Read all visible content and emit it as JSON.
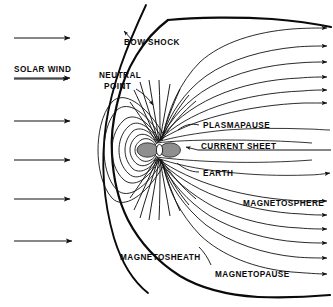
{
  "figure": {
    "background_color": "#ffffff",
    "ink_color": "#0b0b0b",
    "belt_fill_color": "#8f8f8f",
    "width": 333,
    "height": 307
  },
  "labels": {
    "bow_shock": "BOW SHOCK",
    "neutral": "NEUTRAL",
    "point": "POINT",
    "solar_wind": "SOLAR WIND",
    "plasmapause": "PLASMAPAUSE",
    "current_sheet": "CURRENT SHEET",
    "earth": "EARTH",
    "magnetosphere": "MAGNETOSPHERE",
    "magnetosheath": "MAGNETOSHEATH",
    "magnetopause": "MAGNETOPAUSE"
  },
  "solar_wind_arrows": {
    "count": 6,
    "direction": "right",
    "y_positions": [
      38,
      78,
      121,
      160,
      199,
      241
    ],
    "x_start": 14,
    "x_end": 74
  },
  "tail_field_arrows": {
    "count": 11,
    "direction": "right",
    "description": "arrowheads on magnetotail field lines pointing tailward"
  },
  "regions": [
    {
      "name": "bow-shock",
      "kind": "boundary-curve",
      "label": "BOW SHOCK"
    },
    {
      "name": "magnetosheath",
      "kind": "region",
      "label": "MAGNETOSHEATH"
    },
    {
      "name": "magnetopause",
      "kind": "boundary-curve",
      "label": "MAGNETOPAUSE"
    },
    {
      "name": "magnetosphere",
      "kind": "region",
      "label": "MAGNETOSPHERE"
    },
    {
      "name": "plasmapause",
      "kind": "boundary-curve",
      "label": "PLASMAPAUSE"
    },
    {
      "name": "current-sheet",
      "kind": "line-feature",
      "label": "CURRENT SHEET"
    },
    {
      "name": "neutral-point",
      "kind": "point-feature",
      "label": "NEUTRAL POINT"
    },
    {
      "name": "earth",
      "kind": "body",
      "label": "EARTH"
    }
  ]
}
